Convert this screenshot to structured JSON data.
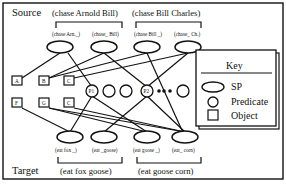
{
  "source": {
    "label": "Source",
    "groups": [
      "(chase Arnold Bill)",
      "(chase Bill Charles)"
    ],
    "sp_nodes": [
      "(chase Arn._)",
      "(chase_ Bill)",
      "(chase Bill _)",
      "(chase_ Ch.)"
    ]
  },
  "target": {
    "label": "Target",
    "groups": [
      "(eat fox goose)",
      "(eat goose corn)"
    ],
    "sp_nodes": [
      "(eat fox _)",
      "(eat _goose)",
      "(eat goose _)",
      "(eat_ corn)"
    ]
  },
  "objects": {
    "row1": [
      "A",
      "B",
      "C"
    ],
    "row2": [
      "F",
      "G",
      "C"
    ]
  },
  "predicates": [
    "P1",
    "",
    "",
    "P2",
    ""
  ],
  "key": {
    "title": "Key",
    "items": [
      {
        "shape": "ellipse",
        "label": "SP"
      },
      {
        "shape": "circle",
        "label": "Predicate"
      },
      {
        "shape": "square",
        "label": "Object"
      }
    ]
  }
}
